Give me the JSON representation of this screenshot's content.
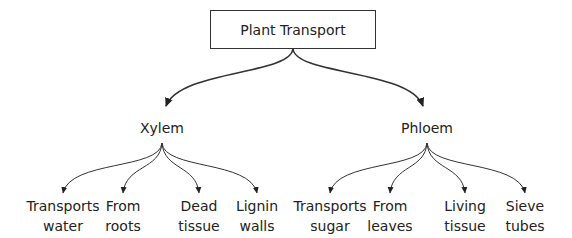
{
  "root": {
    "label": "Plant Transport"
  },
  "branches": [
    {
      "label": "Xylem",
      "children": [
        {
          "line1": "Transports",
          "line2": "water"
        },
        {
          "line1": "From",
          "line2": "roots"
        },
        {
          "line1": "Dead",
          "line2": "tissue"
        },
        {
          "line1": "Lignin",
          "line2": "walls"
        }
      ]
    },
    {
      "label": "Phloem",
      "children": [
        {
          "line1": "Transports",
          "line2": "sugar"
        },
        {
          "line1": "From",
          "line2": "leaves"
        },
        {
          "line1": "Living",
          "line2": "tissue"
        },
        {
          "line1": "Sieve",
          "line2": "tubes"
        }
      ]
    }
  ],
  "colors": {
    "line": "#333333",
    "text": "#222222",
    "background": "#ffffff"
  }
}
